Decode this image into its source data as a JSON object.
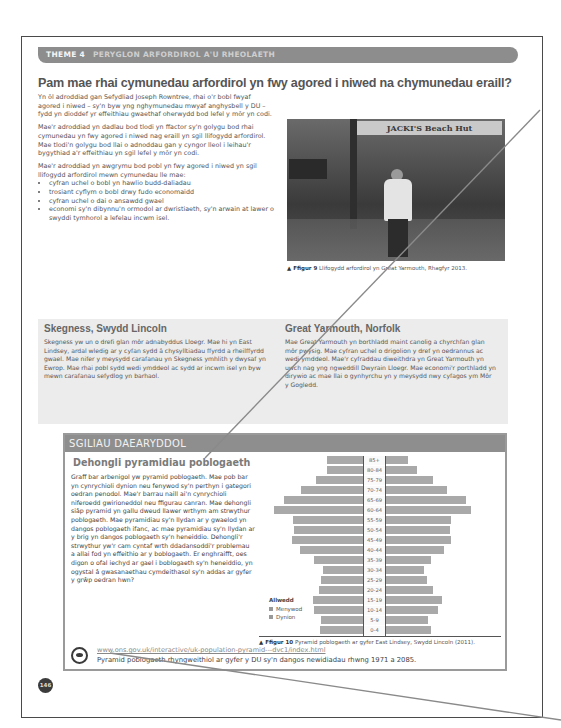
{
  "header": {
    "theme_number": "THEME 4",
    "theme_title": "PERYGLON ARFORDIROL A'U RHEOLAETH"
  },
  "main_title": "Pam mae rhai cymunedau arfordirol yn fwy agored i niwed na chymunedau eraill?",
  "intro": {
    "paragraphs": [
      "Yn ôl adroddiad gan Sefydliad Joseph Rowntree, rhai o'r bobl fwyaf agored i niwed – sy'n byw yng nghymunedau mwyaf anghysbell y DU – fydd yn dioddef yr effeithiau gwaethaf oherwydd bod lefel y môr yn codi.",
      "Mae'r adroddiad yn dadlau bod tlodi yn ffactor sy'n golygu bod rhai cymunedau yn fwy agored i niwed nag eraill yn sgil llifogydd arfordirol. Mae tlodi'n golygu bod llai o adnoddau gan y cyngor lleol i leihau'r bygythiad a'r effeithiau yn sgil lefel y môr yn codi.",
      "Mae'r adroddiad yn awgrymu bod pobl yn fwy agored i niwed yn sgil llifogydd arfordirol mewn cymunedau lle mae:"
    ],
    "bullets": [
      "cyfran uchel o bobl yn hawlio budd-daliadau",
      "trosiant cyflym o bobl drwy fudo economaidd",
      "cyfran uchel o dai o ansawdd gwael",
      "economi sy'n dibynnu'n ormodol ar dwristiaeth, sy'n arwain at lawer o swyddi tymhorol a lefelau incwm isel."
    ]
  },
  "figure9": {
    "sign_text": "JACKI'S Beach Hut",
    "label": "▲ Ffigur 9",
    "caption": "Llifogydd arfordirol yn Great Yarmouth, Rhagfyr 2013."
  },
  "case_studies": [
    {
      "title": "Skegness, Swydd Lincoln",
      "text": "Skegness yw un o drefi glan môr adnabyddus Lloegr. Mae hi yn East Lindsey, ardal wledig ar y cyfan sydd â chysylltiadau ffyrdd a rheilffyrdd gwael. Mae nifer y meysydd carafanau yn Skegness ymhlith y dwysaf yn Ewrop. Mae rhai pobl sydd wedi ymddeol ac sydd ar incwm isel yn byw mewn carafanau sefydlog yn barhaol."
    },
    {
      "title": "Great Yarmouth, Norfolk",
      "text": "Mae Great Yarmouth yn borthladd maint canolig a chyrchfan glan môr pwysig. Mae cyfran uchel o drigolion y dref yn oedrannus ac wedi ymddeol. Mae'r cyfraddau diweithdra yn Great Yarmouth yn uwch nag yng ngweddill Dwyrain Lloegr. Mae economi'r porthladd yn dirywio ac mae llai o gynhyrchu yn y meysydd nwy cyfagos ym Môr y Gogledd."
    }
  ],
  "skills": {
    "header": "SGILIAU DAEARYDDOL",
    "subtitle": "Dehongli pyramidiau poblogaeth",
    "text": "Graff bar arbenigol yw pyramid poblogaeth. Mae pob bar yn cynrychioli dynion neu fenywod sy'n perthyn i gategori oedran penodol. Mae'r barrau naill ai'n cynrychioli niferoedd gwirioneddol neu ffigurau canran. Mae dehongli siâp pyramid yn gallu dweud llawer wrthym am strwythur poblogaeth. Mae pyramidiau sy'n llydan ar y gwaelod yn dangos poblogaeth ifanc, ac mae pyramidiau sy'n llydan ar y brig yn dangos poblogaeth sy'n heneiddio. Dehongli'r strwythur yw'r cam cyntaf wrth ddadansoddi'r problemau a allai fod yn effeithio ar y boblogaeth. Er enghraifft, oes digon o ofal iechyd ar gael i boblogaeth sy'n heneiddio, yn ogystal â gwasanaethau cymdeithasol sy'n addas ar gyfer y grŵp oedran hwn?",
    "legend": {
      "title": "Allwedd",
      "items": [
        "Menywod",
        "Dynion"
      ]
    },
    "figure10": {
      "label": "▲ Ffigur 10",
      "caption": "Pyramid poblogaeth ar gyfer East Lindsey, Swydd Lincoln (2011)."
    },
    "web": {
      "link": "www.ons.gov.uk/interactive/uk-population-pyramid---dvc1/index.html",
      "description": "Pyramid poblogaeth rhyngweithiol ar gyfer y DU sy'n dangos newidiadau rhwng 1971 a 2085."
    }
  },
  "page_number": "146",
  "chart_data": {
    "type": "bar",
    "subtype": "population-pyramid",
    "title": "Pyramid poblogaeth ar gyfer East Lindsey, Swydd Lincoln (2011)",
    "categories": [
      "85+",
      "80-84",
      "75-79",
      "70-74",
      "65-69",
      "60-64",
      "55-59",
      "50-54",
      "45-49",
      "40-44",
      "35-39",
      "30-34",
      "25-29",
      "20-24",
      "15-19",
      "10-14",
      "5-9",
      "0-4"
    ],
    "series": [
      {
        "name": "Left bars",
        "values": [
          36,
          36,
          47,
          62,
          79,
          89,
          70,
          69,
          71,
          63,
          49,
          40,
          42,
          44,
          50,
          49,
          42,
          43
        ]
      },
      {
        "name": "Right bars",
        "values": [
          22,
          31,
          47,
          61,
          80,
          85,
          65,
          64,
          65,
          58,
          45,
          38,
          41,
          47,
          56,
          52,
          42,
          45
        ]
      }
    ],
    "legend": [
      "Menywod",
      "Dynion"
    ],
    "legend_title": "Allwedd",
    "units": "relative bar length (px, no axis scale shown)",
    "grid": false,
    "legend_position": "bottom-left"
  }
}
